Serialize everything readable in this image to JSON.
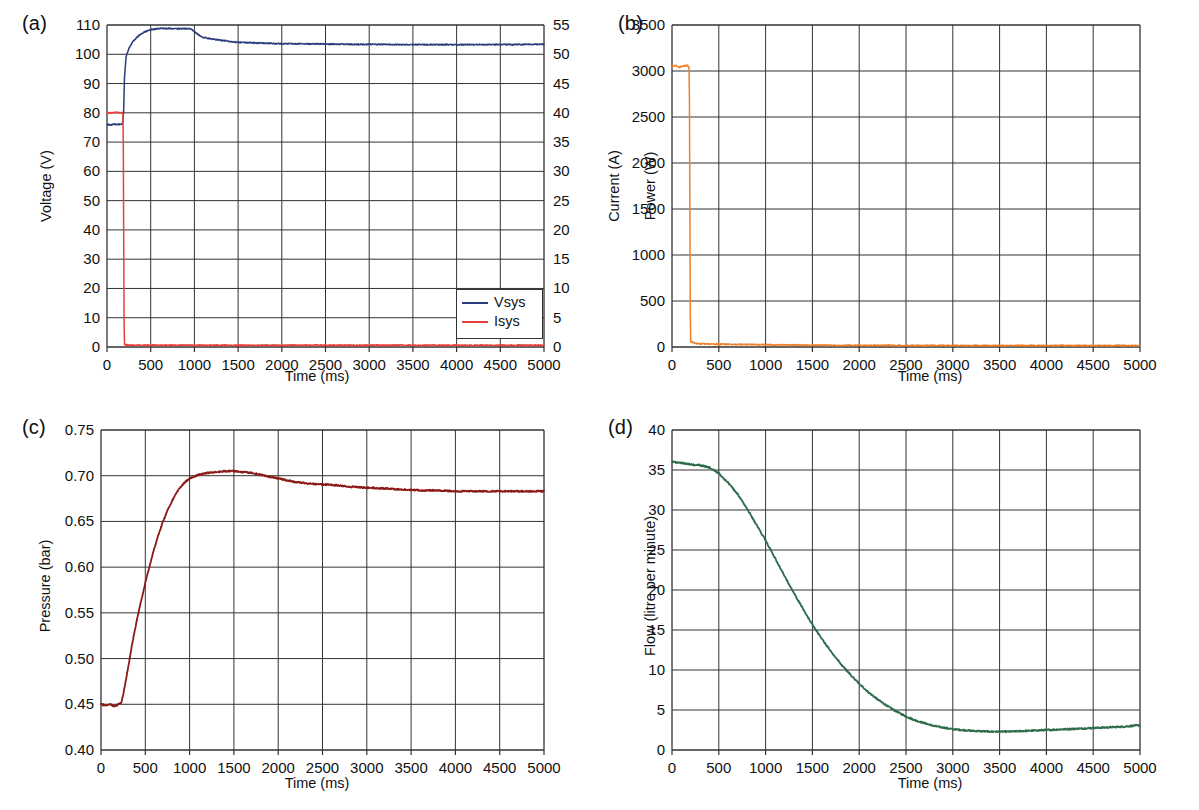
{
  "figure": {
    "background": "#ffffff",
    "panel_count": 4
  },
  "panels": {
    "a": {
      "tag": "(a)",
      "xlabel": "Time (ms)",
      "ylabel": "Voltage (V)",
      "y2label": "Current (A)",
      "legend": {
        "items": [
          {
            "label": "Vsys",
            "color": "#2a3c7d"
          },
          {
            "label": "Isys",
            "color": "#e8413c"
          }
        ]
      },
      "yticks": [
        "0",
        "10",
        "20",
        "30",
        "40",
        "50",
        "60",
        "70",
        "80",
        "90",
        "100",
        "110"
      ],
      "y2ticks": [
        "0",
        "5",
        "10",
        "15",
        "20",
        "25",
        "30",
        "35",
        "40",
        "45",
        "50",
        "55"
      ],
      "xticks": [
        "0",
        "500",
        "1000",
        "1500",
        "2000",
        "2500",
        "3000",
        "3500",
        "4000",
        "4500",
        "5000"
      ]
    },
    "b": {
      "tag": "(b)",
      "xlabel": "Time (ms)",
      "ylabel": "Power (W)",
      "yticks": [
        "0",
        "500",
        "1000",
        "1500",
        "2000",
        "2500",
        "3000",
        "3500"
      ],
      "xticks": [
        "0",
        "500",
        "1000",
        "1500",
        "2000",
        "2500",
        "3000",
        "3500",
        "4000",
        "4500",
        "5000"
      ]
    },
    "c": {
      "tag": "(c)",
      "xlabel": "Time (ms)",
      "ylabel": "Pressure (bar)",
      "yticks": [
        "0.40",
        "0.45",
        "0.50",
        "0.55",
        "0.60",
        "0.65",
        "0.70",
        "0.75"
      ],
      "xticks": [
        "0",
        "500",
        "1000",
        "1500",
        "2000",
        "2500",
        "3000",
        "3500",
        "4000",
        "4500",
        "5000"
      ]
    },
    "d": {
      "tag": "(d)",
      "xlabel": "Time (ms)",
      "ylabel": "Flow (litre per minute)",
      "yticks": [
        "0",
        "5",
        "10",
        "15",
        "20",
        "25",
        "30",
        "35",
        "40"
      ],
      "xticks": [
        "0",
        "500",
        "1000",
        "1500",
        "2000",
        "2500",
        "3000",
        "3500",
        "4000",
        "4500",
        "5000"
      ]
    }
  },
  "chart_data": [
    {
      "id": "a",
      "type": "line",
      "title": "(a)",
      "xlabel": "Time (ms)",
      "ylabel": "Voltage (V)",
      "y2label": "Current (A)",
      "xlim": [
        0,
        5000
      ],
      "ylim": [
        0,
        110
      ],
      "y2lim": [
        0,
        55
      ],
      "grid": true,
      "legend": "inside-lower-right",
      "series": [
        {
          "name": "Vsys",
          "color": "#2a3c7d",
          "axis": "left",
          "units": "V",
          "x": [
            0,
            40,
            80,
            120,
            160,
            180,
            190,
            200,
            220,
            250,
            300,
            350,
            400,
            450,
            500,
            600,
            700,
            800,
            900,
            950,
            1000,
            1050,
            1100,
            1200,
            1300,
            1400,
            1500,
            1600,
            1800,
            2000,
            2200,
            2500,
            2800,
            3000,
            3300,
            3600,
            4000,
            4300,
            4600,
            5000
          ],
          "y": [
            76.0,
            75.9,
            76.1,
            76.0,
            76.0,
            76.2,
            80.0,
            92.0,
            99.5,
            102.0,
            104.5,
            106.0,
            107.2,
            107.9,
            108.4,
            108.8,
            108.8,
            108.7,
            108.8,
            108.7,
            107.8,
            106.5,
            105.8,
            105.2,
            104.8,
            104.4,
            104.1,
            104.0,
            103.8,
            103.6,
            103.6,
            103.5,
            103.4,
            103.4,
            103.3,
            103.3,
            103.3,
            103.3,
            103.3,
            103.4
          ]
        },
        {
          "name": "Isys",
          "color": "#e8413c",
          "axis": "right",
          "units": "A",
          "x": [
            0,
            50,
            100,
            150,
            180,
            185,
            190,
            195,
            200,
            250,
            400,
            700,
            1000,
            1500,
            2000,
            2500,
            3000,
            3500,
            4000,
            4500,
            5000
          ],
          "y": [
            40.0,
            40.0,
            40.1,
            40.0,
            40.0,
            39.8,
            22.5,
            5.0,
            0.4,
            0.3,
            0.3,
            0.3,
            0.3,
            0.3,
            0.3,
            0.3,
            0.3,
            0.3,
            0.3,
            0.3,
            0.3
          ]
        }
      ]
    },
    {
      "id": "b",
      "type": "line",
      "title": "(b)",
      "xlabel": "Time (ms)",
      "ylabel": "Power (W)",
      "xlim": [
        0,
        5000
      ],
      "ylim": [
        0,
        3500
      ],
      "grid": true,
      "series": [
        {
          "name": "Power",
          "color": "#f07f28",
          "units": "W",
          "x": [
            0,
            40,
            80,
            120,
            160,
            180,
            185,
            190,
            195,
            200,
            250,
            300,
            400,
            500,
            700,
            900,
            1000,
            1200,
            1500,
            1800,
            2000,
            2300,
            2600,
            3000,
            3400,
            3800,
            4200,
            4600,
            5000
          ],
          "y": [
            3050,
            3060,
            3040,
            3055,
            3060,
            3045,
            3000,
            1800,
            400,
            60,
            40,
            35,
            32,
            30,
            28,
            26,
            25,
            22,
            20,
            18,
            18,
            17,
            17,
            16,
            16,
            16,
            16,
            16,
            16
          ]
        }
      ]
    },
    {
      "id": "c",
      "type": "line",
      "title": "(c)",
      "xlabel": "Time (ms)",
      "ylabel": "Pressure (bar)",
      "xlim": [
        0,
        5000
      ],
      "ylim": [
        0.4,
        0.75
      ],
      "grid": true,
      "series": [
        {
          "name": "Pressure",
          "color": "#8b1a16",
          "units": "bar",
          "x": [
            0,
            50,
            100,
            150,
            200,
            230,
            260,
            300,
            350,
            400,
            450,
            500,
            550,
            600,
            650,
            700,
            750,
            800,
            850,
            900,
            950,
            1000,
            1100,
            1200,
            1300,
            1400,
            1500,
            1600,
            1700,
            1800,
            1900,
            2000,
            2100,
            2200,
            2400,
            2600,
            2800,
            3000,
            3200,
            3400,
            3600,
            3800,
            4000,
            4300,
            4600,
            5000
          ],
          "y": [
            0.45,
            0.449,
            0.45,
            0.448,
            0.45,
            0.452,
            0.465,
            0.487,
            0.515,
            0.54,
            0.562,
            0.583,
            0.602,
            0.62,
            0.636,
            0.65,
            0.662,
            0.672,
            0.681,
            0.688,
            0.693,
            0.697,
            0.701,
            0.703,
            0.704,
            0.705,
            0.705,
            0.704,
            0.703,
            0.701,
            0.699,
            0.697,
            0.695,
            0.693,
            0.691,
            0.69,
            0.688,
            0.687,
            0.686,
            0.685,
            0.684,
            0.684,
            0.683,
            0.683,
            0.683,
            0.683
          ]
        }
      ]
    },
    {
      "id": "d",
      "type": "line",
      "title": "(d)",
      "xlabel": "Time (ms)",
      "ylabel": "Flow (litre per minute)",
      "xlim": [
        0,
        5000
      ],
      "ylim": [
        0,
        40
      ],
      "grid": true,
      "series": [
        {
          "name": "Flow",
          "color": "#2e6b4a",
          "units": "litre per minute",
          "x": [
            0,
            100,
            200,
            300,
            400,
            500,
            600,
            700,
            800,
            900,
            1000,
            1100,
            1200,
            1300,
            1400,
            1500,
            1600,
            1700,
            1800,
            1900,
            2000,
            2100,
            2200,
            2300,
            2400,
            2500,
            2600,
            2800,
            3000,
            3200,
            3400,
            3600,
            3800,
            4000,
            4200,
            4400,
            4600,
            4800,
            5000
          ],
          "y": [
            36.0,
            35.9,
            35.7,
            35.6,
            35.3,
            34.6,
            33.4,
            32.0,
            30.2,
            28.2,
            26.2,
            24.0,
            21.8,
            19.7,
            17.6,
            15.7,
            13.9,
            12.3,
            10.8,
            9.5,
            8.3,
            7.2,
            6.3,
            5.5,
            4.8,
            4.2,
            3.7,
            3.0,
            2.6,
            2.4,
            2.3,
            2.3,
            2.4,
            2.5,
            2.6,
            2.7,
            2.8,
            2.9,
            3.1
          ]
        }
      ]
    }
  ]
}
